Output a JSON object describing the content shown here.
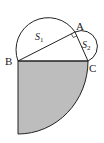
{
  "diagram": {
    "type": "geometry",
    "points": {
      "A": {
        "label": "A",
        "x": 75,
        "y": 32
      },
      "B": {
        "label": "B",
        "x": 18,
        "y": 61
      },
      "C": {
        "label": "C",
        "x": 88,
        "y": 61
      }
    },
    "regions": {
      "s1": {
        "label": "S",
        "sub": "1",
        "desc": "semicircle on BA"
      },
      "s2": {
        "label": "S",
        "sub": "2",
        "desc": "semicircle on AC"
      },
      "quarter": {
        "desc": "shaded quarter circle centered at B with radius BC",
        "fill": "#bdbdbd"
      }
    },
    "right_angle_at": "A",
    "colors": {
      "stroke": "#222222",
      "shade": "#bdbdbd",
      "background": "#ffffff"
    }
  }
}
